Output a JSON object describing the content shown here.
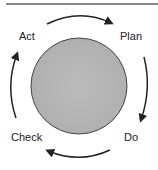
{
  "diagram": {
    "type": "cycle",
    "stages": [
      {
        "label": "Plan"
      },
      {
        "label": "Do"
      },
      {
        "label": "Check"
      },
      {
        "label": "Act"
      }
    ],
    "direction": "clockwise",
    "colors": {
      "center_fill": "#b8b8b8",
      "center_stroke": "#444444",
      "arrow": "#222222",
      "text": "#222222",
      "rule": "#8a8a8a"
    }
  }
}
